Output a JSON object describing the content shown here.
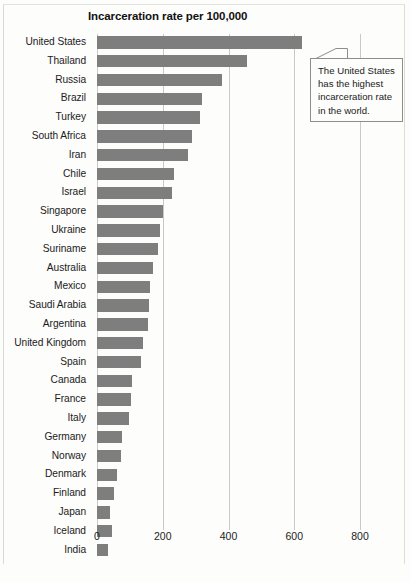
{
  "chart_data": {
    "type": "bar",
    "orientation": "horizontal",
    "title": "Incarceration rate per 100,000",
    "xlabel": "",
    "ylabel": "",
    "xlim": [
      0,
      800
    ],
    "xticks": [
      0,
      200,
      400,
      600,
      800
    ],
    "grid": true,
    "legend": false,
    "bar_color": "#7e7e7e",
    "categories": [
      "United States",
      "Thailand",
      "Russia",
      "Brazil",
      "Turkey",
      "South Africa",
      "Iran",
      "Chile",
      "Israel",
      "Singapore",
      "Ukraine",
      "Suriname",
      "Australia",
      "Mexico",
      "Saudi Arabia",
      "Argentina",
      "United Kingdom",
      "Spain",
      "Canada",
      "France",
      "Italy",
      "Germany",
      "Norway",
      "Denmark",
      "Finland",
      "Japan",
      "Iceland",
      "India"
    ],
    "values": [
      625,
      455,
      380,
      320,
      312,
      290,
      277,
      235,
      228,
      200,
      192,
      186,
      170,
      161,
      158,
      155,
      141,
      134,
      106,
      103,
      98,
      77,
      73,
      61,
      52,
      39,
      45,
      33
    ],
    "annotations": [
      {
        "name": "united-states-callout",
        "lines": [
          "The United States",
          "has the highest",
          "incarceration rate",
          "in the world."
        ],
        "text": "The United States has the highest incarceration rate in the world.",
        "points_to": "United States"
      }
    ]
  }
}
